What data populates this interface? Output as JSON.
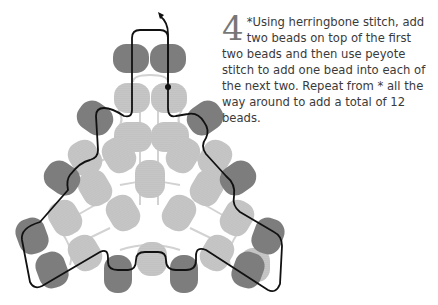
{
  "step": {
    "number": "4",
    "text_first": "*Using herringbone stitch, add two beads on top of the first two beads and then use peyote stitch to add one bead into each of the next two. Repeat from * all the way around to add a total of 12 beads."
  },
  "diagram": {
    "colors": {
      "new_bead": "#7a7a7a",
      "existing_bead": "#c4c4c4",
      "prior_thread": "#cfcfcf",
      "thread": "#111111"
    },
    "new_bead_count": "12"
  }
}
